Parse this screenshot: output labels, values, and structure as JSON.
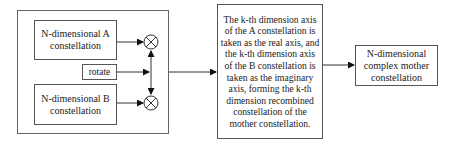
{
  "diagram": {
    "blocks": {
      "a_constellation": "N-dimensional A constellation",
      "b_constellation": "N-dimensional B constellation",
      "rotate": "rotate",
      "recombine_description": "The k-th dimension axis of the A constellation is taken as the real axis, and the k-th dimension axis of the B constellation is taken as the imaginary axis, forming the k-th dimension recombined constellation of the mother constellation.",
      "output": "N-dimensional complex mother constellation"
    },
    "operators": [
      {
        "id": "multiplier-a",
        "symbol": "⊗"
      },
      {
        "id": "multiplier-b",
        "symbol": "⊗"
      }
    ],
    "edges": [
      {
        "from": "a_constellation",
        "to": "multiplier-a"
      },
      {
        "from": "b_constellation",
        "to": "multiplier-b"
      },
      {
        "from": "rotate",
        "to": "multiplier-a"
      },
      {
        "from": "rotate",
        "to": "multiplier-b"
      },
      {
        "from": "group",
        "to": "recombine_description"
      },
      {
        "from": "recombine_description",
        "to": "output"
      }
    ]
  }
}
